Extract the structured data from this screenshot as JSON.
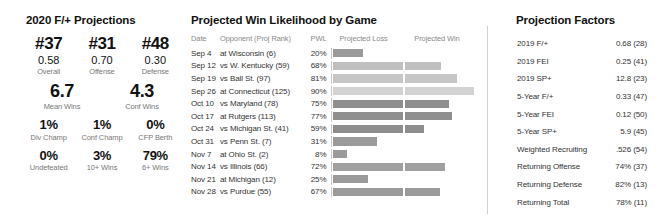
{
  "left": {
    "title": "2020 F/+ Projections",
    "rank_row": [
      {
        "rank": "#37",
        "value": "0.58",
        "label": "Overall"
      },
      {
        "rank": "#31",
        "value": "0.70",
        "label": "Offense"
      },
      {
        "rank": "#48",
        "value": "0.30",
        "label": "Defense"
      }
    ],
    "wins_row": [
      {
        "value": "6.7",
        "label": "Mean Wins"
      },
      {
        "value": "4.3",
        "label": "Conf Wins"
      }
    ],
    "champ_row": [
      {
        "value": "1%",
        "label": "Div Champ"
      },
      {
        "value": "1%",
        "label": "Conf Champ"
      },
      {
        "value": "0%",
        "label": "CFP Berth"
      }
    ],
    "record_row": [
      {
        "value": "0%",
        "label": "Undefeated"
      },
      {
        "value": "3%",
        "label": "10+ Wins"
      },
      {
        "value": "79%",
        "label": "6+ Wins"
      }
    ]
  },
  "schedule": {
    "title": "Projected Win Likelihood by Game",
    "columns": [
      "Date",
      "Opponent (Proj Rank)",
      "PWL",
      "Projected Loss",
      "Projected Win"
    ],
    "rows": [
      {
        "date": "Sep 4",
        "opponent": "at Wisconsin (6)",
        "pwl": "20%",
        "loss_pct": 20,
        "win_pct": 0,
        "shade": "#9a9a9a"
      },
      {
        "date": "Sep 12",
        "opponent": "vs W. Kentucky (59)",
        "pwl": "68%",
        "loss_pct": 48,
        "win_pct": 27,
        "shade": "#c0c0c0"
      },
      {
        "date": "Sep 19",
        "opponent": "vs Ball St. (97)",
        "pwl": "81%",
        "loss_pct": 48,
        "win_pct": 39,
        "shade": "#c6c6c6"
      },
      {
        "date": "Sep 26",
        "opponent": "at Connecticut (125)",
        "pwl": "90%",
        "loss_pct": 48,
        "win_pct": 52,
        "shade": "#d2d2d2"
      },
      {
        "date": "Oct 10",
        "opponent": "vs Maryland (78)",
        "pwl": "75%",
        "loss_pct": 48,
        "win_pct": 33,
        "shade": "#8e8e8e"
      },
      {
        "date": "Oct 17",
        "opponent": "at Rutgers (113)",
        "pwl": "77%",
        "loss_pct": 48,
        "win_pct": 35,
        "shade": "#8e8e8e"
      },
      {
        "date": "Oct 24",
        "opponent": "vs Michigan St. (41)",
        "pwl": "59%",
        "loss_pct": 48,
        "win_pct": 14,
        "shade": "#8e8e8e"
      },
      {
        "date": "Oct 31",
        "opponent": "vs Penn St. (7)",
        "pwl": "31%",
        "loss_pct": 30,
        "win_pct": 0,
        "shade": "#9a9a9a"
      },
      {
        "date": "Nov 7",
        "opponent": "at Ohio St. (2)",
        "pwl": "8%",
        "loss_pct": 9,
        "win_pct": 0,
        "shade": "#9a9a9a"
      },
      {
        "date": "Nov 14",
        "opponent": "vs Illinois (66)",
        "pwl": "72%",
        "loss_pct": 48,
        "win_pct": 30,
        "shade": "#a0a0a0"
      },
      {
        "date": "Nov 21",
        "opponent": "at Michigan (12)",
        "pwl": "25%",
        "loss_pct": 24,
        "win_pct": 0,
        "shade": "#9a9a9a"
      },
      {
        "date": "Nov 28",
        "opponent": "vs Purdue (55)",
        "pwl": "67%",
        "loss_pct": 48,
        "win_pct": 26,
        "shade": "#9a9a9a"
      }
    ]
  },
  "factors": {
    "title": "Projection Factors",
    "rows": [
      {
        "name": "2019 F/+",
        "value": "0.68 (28)"
      },
      {
        "name": "2019 FEI",
        "value": "0.25 (41)"
      },
      {
        "name": "2019 SP+",
        "value": "12.8 (23)"
      },
      {
        "name": "5-Year F/+",
        "value": "0.33 (47)"
      },
      {
        "name": "5-Year FEI",
        "value": "0.12 (50)"
      },
      {
        "name": "5-Year SP+",
        "value": "5.9 (45)"
      },
      {
        "name": "Weighted Recruiting",
        "value": ".526 (54)"
      },
      {
        "name": "Returning Offense",
        "value": "74% (37)"
      },
      {
        "name": "Returning Defense",
        "value": "82% (13)"
      },
      {
        "name": "Returning Total",
        "value": "78% (11)"
      }
    ]
  },
  "chart_data": {
    "type": "bar",
    "title": "Projected Win Likelihood by Game",
    "xlabel": "",
    "ylabel": "",
    "categories": [
      "at Wisconsin (6)",
      "vs W. Kentucky (59)",
      "vs Ball St. (97)",
      "at Connecticut (125)",
      "vs Maryland (78)",
      "at Rutgers (113)",
      "vs Michigan St. (41)",
      "vs Penn St. (7)",
      "at Ohio St. (2)",
      "vs Illinois (66)",
      "at Michigan (12)",
      "vs Purdue (55)"
    ],
    "values": [
      20,
      68,
      81,
      90,
      75,
      77,
      59,
      31,
      8,
      72,
      25,
      67
    ],
    "ylim": [
      0,
      100
    ],
    "grid": false,
    "legend": [
      "Projected Loss",
      "Projected Win"
    ]
  }
}
